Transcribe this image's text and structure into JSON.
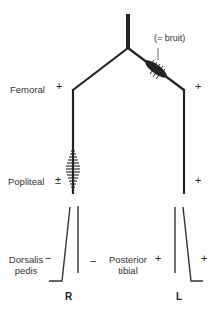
{
  "diagram": {
    "title": "",
    "annotation": "(= bruit)",
    "sites": {
      "femoral": {
        "label": "Femoral",
        "right": "+",
        "left": "+"
      },
      "popliteal": {
        "label": "Popliteal",
        "right": "±",
        "left": "+"
      },
      "dorsalis_pedis": {
        "label_line1": "Dorsalis",
        "label_line2": "pedis",
        "right": "−",
        "left": "+"
      },
      "posterior_tibial": {
        "label_line1": "Posterior",
        "label_line2": "tibial",
        "right": "−",
        "left": "+"
      }
    },
    "sides": {
      "right": "R",
      "left": "L"
    },
    "colors": {
      "line": "#222222",
      "text": "#333333",
      "background": "#ffffff"
    }
  }
}
